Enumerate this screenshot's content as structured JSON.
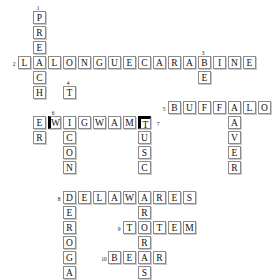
{
  "puzzle": {
    "title": "Crossword Puzzle",
    "cell_size": 15,
    "origin_x": 18,
    "origin_y": 11,
    "entries": [
      {
        "number": "1",
        "answer": "PREACHER",
        "direction": "down",
        "col": 1,
        "row": 0,
        "length": 8
      },
      {
        "number": "2",
        "answer": "LALONGUECARABINE",
        "direction": "across",
        "col": 0,
        "row": 3,
        "length": 16
      },
      {
        "number": "3",
        "answer": "BEAVER",
        "direction": "down",
        "col": 12,
        "row": 3,
        "length": 6
      },
      {
        "number": "4",
        "answer": "TICONDEROGA",
        "direction": "down",
        "col": 3,
        "row": 5,
        "length": 11
      },
      {
        "number": "5",
        "answer": "BUFFALO",
        "direction": "across",
        "col": 10,
        "row": 6,
        "length": 7
      },
      {
        "number": "6",
        "answer": "WIGWAMT",
        "direction": "across",
        "col": 2,
        "row": 7,
        "length": 7
      },
      {
        "number": "7",
        "answer": "TUSCARORAS",
        "direction": "down",
        "col": 8,
        "row": 7,
        "length": 10
      },
      {
        "number": "8",
        "answer": "DELAWARES",
        "direction": "across",
        "col": 3,
        "row": 12,
        "length": 9
      },
      {
        "number": "9",
        "answer": "TOTEM",
        "direction": "across",
        "col": 7,
        "row": 14,
        "length": 5
      },
      {
        "number": "10",
        "answer": "BEAR",
        "direction": "across",
        "col": 6,
        "row": 16,
        "length": 4
      }
    ],
    "cells": [
      {
        "letter": "P",
        "col": 1,
        "row": 0,
        "style": "normal"
      },
      {
        "letter": "R",
        "col": 1,
        "row": 1,
        "style": "normal"
      },
      {
        "letter": "E",
        "col": 1,
        "row": 2,
        "style": "normal"
      },
      {
        "letter": "L",
        "col": 0,
        "row": 3,
        "style": "normal"
      },
      {
        "letter": "A",
        "col": 1,
        "row": 3,
        "style": "normal"
      },
      {
        "letter": "L",
        "col": 2,
        "row": 3,
        "style": "normal"
      },
      {
        "letter": "O",
        "col": 3,
        "row": 3,
        "style": "normal"
      },
      {
        "letter": "N",
        "col": 4,
        "row": 3,
        "style": "normal"
      },
      {
        "letter": "G",
        "col": 5,
        "row": 3,
        "style": "normal"
      },
      {
        "letter": "U",
        "col": 6,
        "row": 3,
        "style": "normal"
      },
      {
        "letter": "E",
        "col": 7,
        "row": 3,
        "style": "normal"
      },
      {
        "letter": "C",
        "col": 8,
        "row": 3,
        "style": "normal"
      },
      {
        "letter": "A",
        "col": 9,
        "row": 3,
        "style": "normal"
      },
      {
        "letter": "R",
        "col": 10,
        "row": 3,
        "style": "normal"
      },
      {
        "letter": "A",
        "col": 11,
        "row": 3,
        "style": "normal"
      },
      {
        "letter": "B",
        "col": 12,
        "row": 3,
        "style": "normal"
      },
      {
        "letter": "I",
        "col": 13,
        "row": 3,
        "style": "normal"
      },
      {
        "letter": "N",
        "col": 14,
        "row": 3,
        "style": "normal"
      },
      {
        "letter": "E",
        "col": 15,
        "row": 3,
        "style": "normal"
      },
      {
        "letter": "C",
        "col": 1,
        "row": 4,
        "style": "normal"
      },
      {
        "letter": "E",
        "col": 12,
        "row": 4,
        "style": "normal"
      },
      {
        "letter": "H",
        "col": 1,
        "row": 5,
        "style": "normal"
      },
      {
        "letter": "T",
        "col": 3,
        "row": 5,
        "style": "normal"
      },
      {
        "letter": "B",
        "col": 10,
        "row": 6,
        "style": "normal"
      },
      {
        "letter": "U",
        "col": 11,
        "row": 6,
        "style": "normal"
      },
      {
        "letter": "F",
        "col": 12,
        "row": 6,
        "style": "normal"
      },
      {
        "letter": "F",
        "col": 13,
        "row": 6,
        "style": "normal"
      },
      {
        "letter": "A",
        "col": 14,
        "row": 6,
        "style": "normal"
      },
      {
        "letter": "L",
        "col": 15,
        "row": 6,
        "style": "normal"
      },
      {
        "letter": "O",
        "col": 16,
        "row": 6,
        "style": "normal"
      },
      {
        "letter": "E",
        "col": 1,
        "row": 7,
        "style": "normal"
      },
      {
        "letter": "W",
        "col": 2,
        "row": 7,
        "style": "thick-left"
      },
      {
        "letter": "I",
        "col": 3,
        "row": 7,
        "style": "normal"
      },
      {
        "letter": "G",
        "col": 4,
        "row": 7,
        "style": "normal"
      },
      {
        "letter": "W",
        "col": 5,
        "row": 7,
        "style": "normal"
      },
      {
        "letter": "A",
        "col": 6,
        "row": 7,
        "style": "normal"
      },
      {
        "letter": "M",
        "col": 7,
        "row": 7,
        "style": "normal"
      },
      {
        "letter": "T",
        "col": 8,
        "row": 7,
        "style": "thick-top"
      },
      {
        "letter": "A",
        "col": 14,
        "row": 7,
        "style": "normal"
      },
      {
        "letter": "R",
        "col": 1,
        "row": 8,
        "style": "normal"
      },
      {
        "letter": "C",
        "col": 3,
        "row": 8,
        "style": "normal"
      },
      {
        "letter": "U",
        "col": 8,
        "row": 8,
        "style": "normal"
      },
      {
        "letter": "V",
        "col": 14,
        "row": 8,
        "style": "normal"
      },
      {
        "letter": "O",
        "col": 3,
        "row": 9,
        "style": "normal"
      },
      {
        "letter": "S",
        "col": 8,
        "row": 9,
        "style": "normal"
      },
      {
        "letter": "E",
        "col": 14,
        "row": 9,
        "style": "normal"
      },
      {
        "letter": "N",
        "col": 3,
        "row": 10,
        "style": "normal"
      },
      {
        "letter": "C",
        "col": 8,
        "row": 10,
        "style": "normal"
      },
      {
        "letter": "R",
        "col": 14,
        "row": 10,
        "style": "normal"
      },
      {
        "letter": "D",
        "col": 3,
        "row": 12,
        "style": "normal"
      },
      {
        "letter": "E",
        "col": 4,
        "row": 12,
        "style": "normal"
      },
      {
        "letter": "L",
        "col": 5,
        "row": 12,
        "style": "normal"
      },
      {
        "letter": "A",
        "col": 6,
        "row": 12,
        "style": "normal"
      },
      {
        "letter": "W",
        "col": 7,
        "row": 12,
        "style": "normal"
      },
      {
        "letter": "A",
        "col": 8,
        "row": 12,
        "style": "normal"
      },
      {
        "letter": "R",
        "col": 9,
        "row": 12,
        "style": "normal"
      },
      {
        "letter": "E",
        "col": 10,
        "row": 12,
        "style": "normal"
      },
      {
        "letter": "S",
        "col": 11,
        "row": 12,
        "style": "normal"
      },
      {
        "letter": "E",
        "col": 3,
        "row": 13,
        "style": "normal"
      },
      {
        "letter": "R",
        "col": 8,
        "row": 13,
        "style": "normal"
      },
      {
        "letter": "R",
        "col": 3,
        "row": 14,
        "style": "normal"
      },
      {
        "letter": "T",
        "col": 7,
        "row": 14,
        "style": "normal"
      },
      {
        "letter": "O",
        "col": 8,
        "row": 14,
        "style": "normal"
      },
      {
        "letter": "T",
        "col": 9,
        "row": 14,
        "style": "normal"
      },
      {
        "letter": "E",
        "col": 10,
        "row": 14,
        "style": "normal"
      },
      {
        "letter": "M",
        "col": 11,
        "row": 14,
        "style": "normal"
      },
      {
        "letter": "O",
        "col": 3,
        "row": 15,
        "style": "normal"
      },
      {
        "letter": "R",
        "col": 8,
        "row": 15,
        "style": "normal"
      },
      {
        "letter": "G",
        "col": 3,
        "row": 16,
        "style": "normal"
      },
      {
        "letter": "B",
        "col": 6,
        "row": 16,
        "style": "normal"
      },
      {
        "letter": "E",
        "col": 7,
        "row": 16,
        "style": "normal"
      },
      {
        "letter": "A",
        "col": 8,
        "row": 16,
        "style": "normal"
      },
      {
        "letter": "R",
        "col": 9,
        "row": 16,
        "style": "normal"
      },
      {
        "letter": "A",
        "col": 3,
        "row": 17,
        "style": "normal"
      },
      {
        "letter": "S",
        "col": 8,
        "row": 17,
        "style": "normal"
      }
    ],
    "numbers": [
      {
        "label": "1",
        "col": 1,
        "row": 0,
        "pos": "above"
      },
      {
        "label": "2",
        "col": 0,
        "row": 3,
        "pos": "left"
      },
      {
        "label": "3",
        "col": 12,
        "row": 3,
        "pos": "above"
      },
      {
        "label": "4",
        "col": 3,
        "row": 5,
        "pos": "above"
      },
      {
        "label": "5",
        "col": 10,
        "row": 6,
        "pos": "left"
      },
      {
        "label": "6",
        "col": 2,
        "row": 7,
        "pos": "above"
      },
      {
        "label": "7",
        "col": 9,
        "row": 7,
        "pos": "inline-right"
      },
      {
        "label": "8",
        "col": 3,
        "row": 12,
        "pos": "left"
      },
      {
        "label": "9",
        "col": 7,
        "row": 14,
        "pos": "left"
      },
      {
        "label": "10",
        "col": 6,
        "row": 16,
        "pos": "left"
      }
    ]
  }
}
